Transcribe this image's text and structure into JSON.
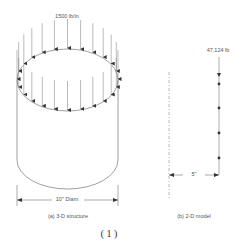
{
  "figure": {
    "load_label": "1500 lb/in",
    "diameter_label": "10\" Diam",
    "caption_a": "(a) 3-D structure",
    "model_load_label": "47,124 lb",
    "model_offset_label": "5\"",
    "caption_b": "(b) 2-D model",
    "figure_number": "(1)"
  },
  "colors": {
    "line": "#777777",
    "arrow": "#333333",
    "text": "#555555"
  }
}
